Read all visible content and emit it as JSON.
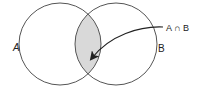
{
  "diagram": {
    "type": "venn",
    "sets": [
      {
        "id": "A",
        "label": "A",
        "cx": 60,
        "cy": 44,
        "r": 41
      },
      {
        "id": "B",
        "label": "B",
        "cx": 116,
        "cy": 44,
        "r": 41
      }
    ],
    "intersection": {
      "label": "A ∩ B",
      "fill": "#d9d9d9"
    },
    "colors": {
      "stroke": "#555555",
      "background": "#ffffff",
      "arrow": "#222222"
    }
  }
}
